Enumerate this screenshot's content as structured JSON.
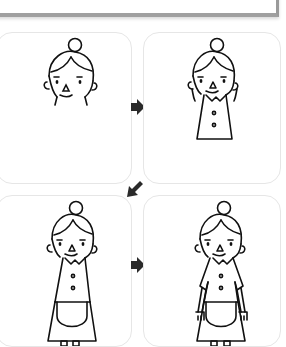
{
  "steps": [
    {
      "number": "1",
      "description": "Draw the head with hair bun, face, ears"
    },
    {
      "number": "2",
      "description": "Add collar and triangular dress body with buttons"
    },
    {
      "number": "3",
      "description": "Add apron and feet"
    },
    {
      "number": "4",
      "description": "Add sleeves, arms and hands"
    }
  ],
  "colors": {
    "line": "#111111",
    "arrow": "#2a2a2a",
    "panel_border": "#e6e6e6"
  }
}
